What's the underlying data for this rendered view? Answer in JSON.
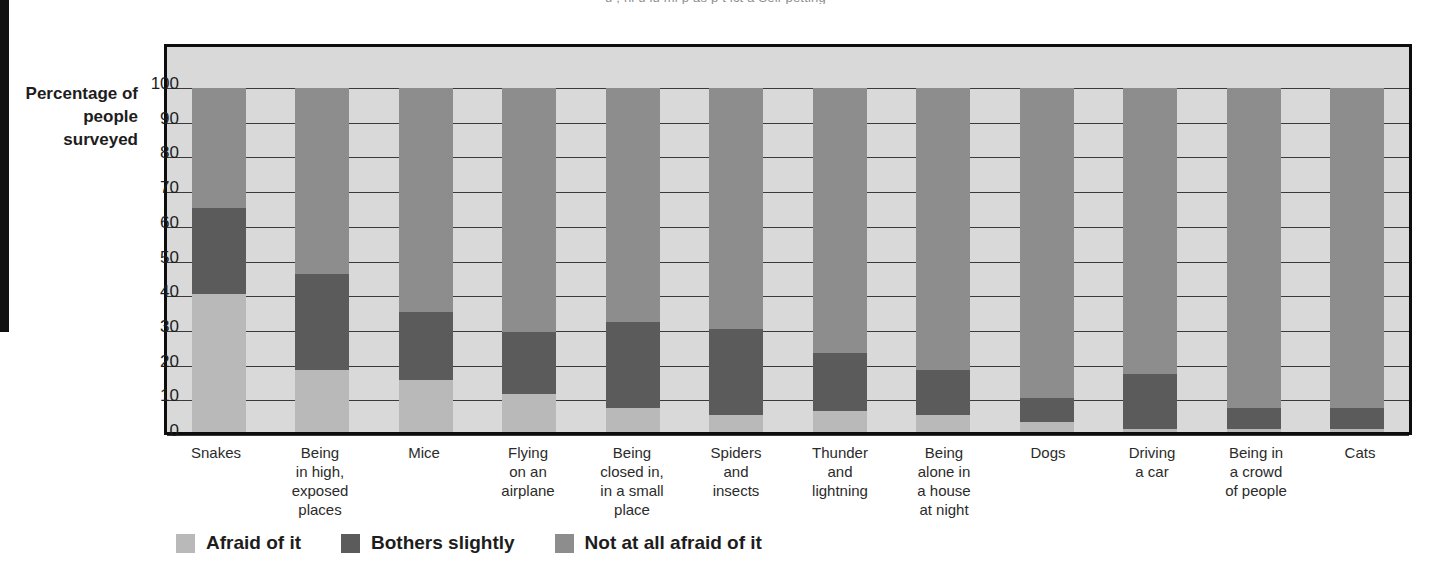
{
  "page": {
    "top_clipped_text": "u ; hi     u iu ml p  as     p  t ict a Sell-petting"
  },
  "chart_data": {
    "type": "bar",
    "subtype": "stacked-100-vertical",
    "title": "",
    "xlabel": "",
    "ylabel": "Percentage of people surveyed",
    "ylim": [
      0,
      100
    ],
    "ytick_labels": [
      "100",
      "90",
      "80",
      "70",
      "60",
      "50",
      "40",
      "30",
      "20",
      "10",
      "0"
    ],
    "ytick_values": [
      100,
      90,
      80,
      70,
      60,
      50,
      40,
      30,
      20,
      10,
      0
    ],
    "grid": true,
    "legend_position": "bottom-left",
    "categories": [
      "Snakes",
      "Being in high, exposed places",
      "Mice",
      "Flying on an airplane",
      "Being closed in, in a small place",
      "Spiders and insects",
      "Thunder and lightning",
      "Being alone in a house at night",
      "Dogs",
      "Driving a car",
      "Being in a crowd of people",
      "Cats"
    ],
    "category_lines": [
      [
        "Snakes"
      ],
      [
        "Being",
        "in high,",
        "exposed",
        "places"
      ],
      [
        "Mice"
      ],
      [
        "Flying",
        "on an",
        "airplane"
      ],
      [
        "Being",
        "closed in,",
        "in a small",
        "place"
      ],
      [
        "Spiders",
        "and",
        "insects"
      ],
      [
        "Thunder",
        "and",
        "lightning"
      ],
      [
        "Being",
        "alone in",
        "a house",
        "at night"
      ],
      [
        "Dogs"
      ],
      [
        "Driving",
        "a car"
      ],
      [
        "Being in",
        "a crowd",
        "of people"
      ],
      [
        "Cats"
      ]
    ],
    "series": [
      {
        "name": "Afraid of it",
        "color": "#b9b9b9",
        "values": [
          40,
          18,
          15,
          11,
          7,
          5,
          6,
          5,
          3,
          1,
          1,
          1
        ]
      },
      {
        "name": "Bothers slightly",
        "color": "#5b5b5b",
        "values": [
          25,
          28,
          20,
          18,
          25,
          25,
          17,
          13,
          7,
          16,
          6,
          6
        ]
      },
      {
        "name": "Not at all afraid of it",
        "color": "#8d8d8d",
        "values": [
          35,
          54,
          65,
          71,
          68,
          70,
          77,
          82,
          90,
          83,
          93,
          93
        ]
      }
    ],
    "colors": {
      "afraid": "#b9b9b9",
      "bothers": "#5b5b5b",
      "not_afraid": "#8d8d8d",
      "plot_background": "#d9d9d9",
      "frame": "#0d0d0d",
      "gridline": "#3a3a3a"
    }
  }
}
